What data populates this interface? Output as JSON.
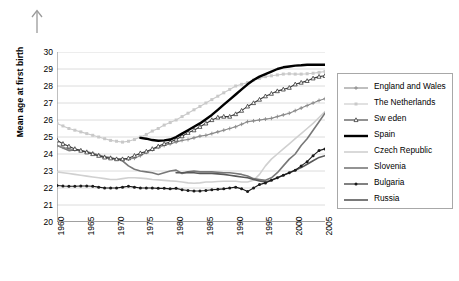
{
  "arrow": {
    "icon": "up-arrow-icon"
  },
  "axes": {
    "y_title": "Mean age at first birth",
    "y_ticks": [
      20,
      21,
      22,
      23,
      24,
      25,
      26,
      27,
      28,
      29,
      30
    ],
    "x_ticks": [
      1960,
      1965,
      1970,
      1975,
      1980,
      1985,
      1990,
      1995,
      2000,
      2005
    ]
  },
  "legend": {
    "items": [
      {
        "label": "England and Wales",
        "color": "#8a8a8a",
        "marker": "plus",
        "width": 1.1
      },
      {
        "label": "The Netherlands",
        "color": "#c9c9c9",
        "marker": "square",
        "width": 1.1
      },
      {
        "label": "Sw eden",
        "color": "#3a3a3a",
        "marker": "triangle",
        "width": 1.1
      },
      {
        "label": "Spain",
        "color": "#000000",
        "marker": "none",
        "width": 2.4
      },
      {
        "label": "Czech Republic",
        "color": "#d0d0d0",
        "marker": "none",
        "width": 1.6
      },
      {
        "label": "Slovenia",
        "color": "#787878",
        "marker": "none",
        "width": 1.6
      },
      {
        "label": "Bulgaria",
        "color": "#1a1a1a",
        "marker": "dot",
        "width": 1.1
      },
      {
        "label": "Russia",
        "color": "#595959",
        "marker": "none",
        "width": 1.6
      }
    ]
  },
  "chart_data": {
    "type": "line",
    "title": "",
    "xlabel": "",
    "ylabel": "Mean age at first birth",
    "xlim": [
      1960,
      2005
    ],
    "ylim": [
      20,
      30
    ],
    "grid": true,
    "legend_position": "right",
    "x": [
      1960,
      1961,
      1962,
      1963,
      1964,
      1965,
      1966,
      1967,
      1968,
      1969,
      1970,
      1971,
      1972,
      1973,
      1974,
      1975,
      1976,
      1977,
      1978,
      1979,
      1980,
      1981,
      1982,
      1983,
      1984,
      1985,
      1986,
      1987,
      1988,
      1989,
      1990,
      1991,
      1992,
      1993,
      1994,
      1995,
      1996,
      1997,
      1998,
      1999,
      2000,
      2001,
      2002,
      2003,
      2004,
      2005
    ],
    "series": [
      {
        "name": "England and Wales",
        "color": "#8a8a8a",
        "marker": "plus",
        "values": [
          24.5,
          24.4,
          24.3,
          24.25,
          24.2,
          24.15,
          24.05,
          23.95,
          23.85,
          23.8,
          23.7,
          23.7,
          23.7,
          23.75,
          23.9,
          24.1,
          24.25,
          24.4,
          24.5,
          24.6,
          24.7,
          24.8,
          24.85,
          24.95,
          25.05,
          25.1,
          25.2,
          25.3,
          25.4,
          25.5,
          25.6,
          25.75,
          25.9,
          25.95,
          26.0,
          26.05,
          26.1,
          26.2,
          26.3,
          26.4,
          26.55,
          26.7,
          26.85,
          27.0,
          27.15,
          27.25
        ]
      },
      {
        "name": "The Netherlands",
        "color": "#c9c9c9",
        "marker": "square",
        "values": [
          25.8,
          25.65,
          25.5,
          25.4,
          25.3,
          25.2,
          25.1,
          25.0,
          24.9,
          24.8,
          24.75,
          24.7,
          24.75,
          24.85,
          25.0,
          25.15,
          25.35,
          25.5,
          25.7,
          25.85,
          26.0,
          26.2,
          26.4,
          26.6,
          26.8,
          27.0,
          27.2,
          27.4,
          27.6,
          27.8,
          28.0,
          28.1,
          28.2,
          28.35,
          28.45,
          28.55,
          28.6,
          28.65,
          28.7,
          28.72,
          28.7,
          28.7,
          28.72,
          28.75,
          28.8,
          28.85
        ]
      },
      {
        "name": "Sw eden",
        "color": "#3a3a3a",
        "marker": "triangle",
        "values": [
          24.8,
          24.6,
          24.45,
          24.3,
          24.2,
          24.1,
          24.0,
          23.9,
          23.8,
          23.75,
          23.7,
          23.7,
          23.75,
          23.9,
          24.05,
          24.15,
          24.3,
          24.45,
          24.6,
          24.7,
          24.85,
          25.05,
          25.25,
          25.4,
          25.6,
          25.8,
          26.0,
          26.15,
          26.2,
          26.2,
          26.35,
          26.55,
          26.8,
          27.0,
          27.2,
          27.4,
          27.55,
          27.7,
          27.8,
          27.9,
          28.1,
          28.2,
          28.3,
          28.45,
          28.55,
          28.6
        ]
      },
      {
        "name": "Spain",
        "color": "#000000",
        "marker": "none",
        "values": [
          null,
          null,
          null,
          null,
          null,
          null,
          null,
          null,
          null,
          null,
          null,
          null,
          null,
          null,
          24.95,
          24.9,
          24.82,
          24.78,
          24.8,
          24.85,
          25.0,
          25.2,
          25.4,
          25.6,
          25.8,
          26.05,
          26.3,
          26.6,
          26.9,
          27.2,
          27.5,
          27.8,
          28.1,
          28.35,
          28.55,
          28.7,
          28.85,
          29.0,
          29.1,
          29.15,
          29.2,
          29.22,
          29.25,
          29.25,
          29.25,
          29.25
        ]
      },
      {
        "name": "Czech Republic",
        "color": "#d0d0d0",
        "marker": "none",
        "values": [
          22.95,
          22.9,
          22.85,
          22.8,
          22.75,
          22.7,
          22.65,
          22.6,
          22.55,
          22.5,
          22.5,
          22.55,
          22.6,
          22.6,
          22.58,
          22.55,
          22.5,
          22.48,
          22.45,
          22.42,
          22.4,
          22.35,
          22.3,
          22.28,
          22.3,
          22.35,
          22.35,
          22.38,
          22.4,
          22.4,
          22.4,
          22.35,
          22.35,
          22.45,
          22.8,
          23.3,
          23.7,
          24.0,
          24.3,
          24.6,
          24.9,
          25.2,
          25.5,
          25.8,
          26.15,
          26.5
        ]
      },
      {
        "name": "Slovenia",
        "color": "#787878",
        "marker": "none",
        "values": [
          24.5,
          24.35,
          24.2,
          24.25,
          24.2,
          24.1,
          24.0,
          23.9,
          23.8,
          23.75,
          23.7,
          23.6,
          23.3,
          23.1,
          23.0,
          22.95,
          22.9,
          22.8,
          22.9,
          23.0,
          23.05,
          22.85,
          22.95,
          23.0,
          22.95,
          22.95,
          22.95,
          22.93,
          22.9,
          22.9,
          22.85,
          22.8,
          22.7,
          22.55,
          22.5,
          22.45,
          22.6,
          22.9,
          23.3,
          23.7,
          24.0,
          24.5,
          24.9,
          25.4,
          25.9,
          26.4
        ]
      },
      {
        "name": "Bulgaria",
        "color": "#1a1a1a",
        "marker": "dot",
        "values": [
          22.15,
          22.12,
          22.1,
          22.1,
          22.12,
          22.12,
          22.1,
          22.05,
          22.0,
          22.0,
          22.0,
          22.05,
          22.1,
          22.05,
          22.0,
          22.0,
          22.0,
          21.98,
          21.98,
          21.95,
          21.98,
          21.9,
          21.85,
          21.82,
          21.82,
          21.85,
          21.9,
          21.92,
          21.95,
          22.0,
          22.05,
          21.95,
          21.8,
          22.0,
          22.2,
          22.3,
          22.45,
          22.6,
          22.75,
          22.9,
          23.05,
          23.3,
          23.55,
          23.9,
          24.2,
          24.3
        ]
      },
      {
        "name": "Russia",
        "color": "#595959",
        "marker": "none",
        "values": [
          null,
          null,
          null,
          null,
          null,
          null,
          null,
          null,
          null,
          null,
          null,
          null,
          null,
          null,
          null,
          null,
          null,
          null,
          null,
          null,
          22.9,
          22.9,
          22.92,
          22.9,
          22.85,
          22.85,
          22.85,
          22.83,
          22.8,
          22.75,
          22.7,
          22.65,
          22.6,
          22.5,
          22.42,
          22.35,
          22.45,
          22.6,
          22.75,
          22.9,
          23.05,
          23.2,
          23.4,
          23.6,
          23.8,
          23.9
        ]
      }
    ]
  }
}
